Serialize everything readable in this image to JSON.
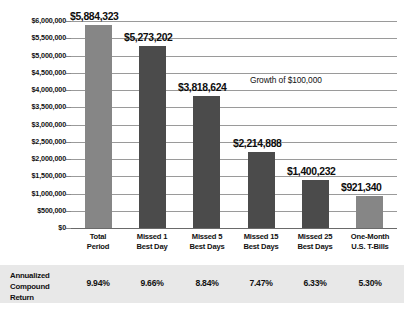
{
  "chart_data": {
    "type": "bar",
    "title": "",
    "annotation": "Growth of $100,000",
    "xlabel": "",
    "ylabel": "",
    "ylim": [
      0,
      6000000
    ],
    "grid": true,
    "legend_position": "none",
    "ytick_labels": [
      "$6,000,000",
      "$5,500,000",
      "$5,000,000",
      "$4,500,000",
      "$4,000,000",
      "$3,500,000",
      "$3,000,000",
      "$2,500,000",
      "$2,000,000",
      "$1,500,000",
      "$1,000,000",
      "$500,000",
      "$0"
    ],
    "ytick_values": [
      6000000,
      5500000,
      5000000,
      4500000,
      4000000,
      3500000,
      3000000,
      2500000,
      2000000,
      1500000,
      1000000,
      500000,
      0
    ],
    "categories": [
      "Total Period",
      "Missed 1 Best Day",
      "Missed 5 Best Days",
      "Missed 15 Best Days",
      "Missed 25 Best Days",
      "One-Month U.S. T-Bills"
    ],
    "category_lines": [
      [
        "Total",
        "Period"
      ],
      [
        "Missed 1",
        "Best Day"
      ],
      [
        "Missed 5",
        "Best Days"
      ],
      [
        "Missed 15",
        "Best Days"
      ],
      [
        "Missed 25",
        "Best Days"
      ],
      [
        "One-Month",
        "U.S. T-Bills"
      ]
    ],
    "values": [
      5884323,
      5273202,
      3818624,
      2214888,
      1400232,
      921340
    ],
    "value_labels": [
      "$5,884,323",
      "$5,273,202",
      "$3,818,624",
      "$2,214,888",
      "$1,400,232",
      "$921,340"
    ],
    "bar_colors": [
      "#868686",
      "#4b4b4b",
      "#4b4b4b",
      "#4b4b4b",
      "#4b4b4b",
      "#868686"
    ],
    "colors": {
      "bar_light": "#868686",
      "bar_dark": "#4b4b4b",
      "gridline": "#9a9a9a",
      "band_background": "#e8e8e8",
      "text": "#111111"
    }
  },
  "data_band": {
    "row_label_lines": [
      "Annualized",
      "Compound",
      "Return"
    ],
    "row_label": "Annualized Compound Return",
    "values": [
      "9.94%",
      "9.66%",
      "8.84%",
      "7.47%",
      "6.33%",
      "5.30%"
    ]
  }
}
